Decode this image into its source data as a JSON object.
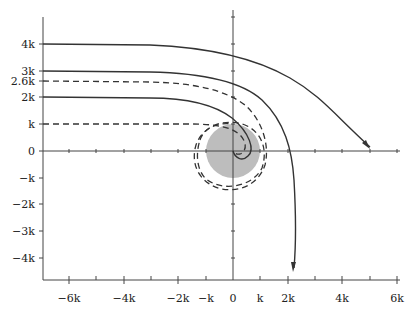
{
  "diagram": {
    "title": "",
    "axis_unit": "k",
    "y_ticks": [
      {
        "value": 4,
        "label": "4k"
      },
      {
        "value": 3,
        "label": "3k"
      },
      {
        "value": 2.6,
        "label": "2.6k"
      },
      {
        "value": 2,
        "label": "2k"
      },
      {
        "value": 1,
        "label": "k"
      },
      {
        "value": 0,
        "label": "0"
      },
      {
        "value": -1,
        "label": "−k"
      },
      {
        "value": -2,
        "label": "−2k"
      },
      {
        "value": -3,
        "label": "−3k"
      },
      {
        "value": -4,
        "label": "−4k"
      }
    ],
    "x_ticks": [
      {
        "value": -6,
        "label": "−6k"
      },
      {
        "value": -4,
        "label": "−4k"
      },
      {
        "value": -2,
        "label": "−2k"
      },
      {
        "value": -1,
        "label": "−k"
      },
      {
        "value": 0,
        "label": "0"
      },
      {
        "value": 1,
        "label": "k"
      },
      {
        "value": 2,
        "label": "2k"
      },
      {
        "value": 4,
        "label": "4k"
      },
      {
        "value": 6,
        "label": "6k"
      }
    ],
    "target_disk": {
      "center": [
        0,
        0
      ],
      "radius": 1,
      "color": "#bdbdbd"
    },
    "trajectories": [
      {
        "impact_parameter": "4k",
        "style": "solid",
        "outcome": "deflected, exits toward (5k, 0)"
      },
      {
        "impact_parameter": "3k",
        "style": "solid",
        "outcome": "deflected downward, exits near (2.2k, -4.5k)"
      },
      {
        "impact_parameter": "2.6k",
        "style": "dashed",
        "outcome": "orbits around center"
      },
      {
        "impact_parameter": "2k",
        "style": "solid",
        "outcome": "spirals in to center"
      },
      {
        "impact_parameter": "k",
        "style": "dashed",
        "outcome": "spirals in to center"
      }
    ],
    "colors": {
      "line": "#333333",
      "disk": "#bdbdbd",
      "axis": "#444444"
    }
  }
}
